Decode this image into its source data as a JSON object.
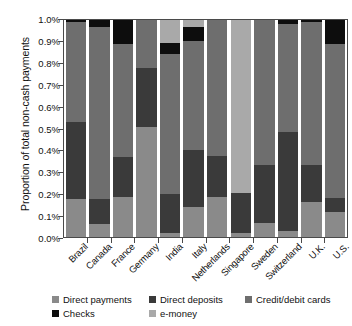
{
  "chart_data": {
    "type": "bar",
    "stacked": true,
    "title": "",
    "xlabel": "",
    "ylabel": "Proportion of total non-cash payments",
    "ylim": [
      0,
      1.0
    ],
    "ytick_labels": [
      "0.0%",
      "0.1%",
      "0.2%",
      "0.3%",
      "0.4%",
      "0.5%",
      "0.6%",
      "0.7%",
      "0.8%",
      "0.9%",
      "1.0%"
    ],
    "ytick_values": [
      0,
      0.1,
      0.2,
      0.3,
      0.4,
      0.5,
      0.6,
      0.7,
      0.8,
      0.9,
      1.0
    ],
    "grid": false,
    "legend_position": "bottom",
    "categories": [
      "Brazil",
      "Canada",
      "France",
      "Germany",
      "India",
      "Italy",
      "Netherlands",
      "Singapore",
      "Sweden",
      "Switzerland",
      "U.K.",
      "U.S."
    ],
    "series": [
      {
        "name": "Direct payments",
        "color": "#8a8a8a",
        "values": [
          0.175,
          0.06,
          0.185,
          0.505,
          0.02,
          0.14,
          0.185,
          0.02,
          0.065,
          0.03,
          0.16,
          0.115
        ]
      },
      {
        "name": "Direct deposits",
        "color": "#3a3a3a",
        "values": [
          0.355,
          0.115,
          0.185,
          0.275,
          0.18,
          0.26,
          0.19,
          0.185,
          0.265,
          0.455,
          0.17,
          0.065
        ]
      },
      {
        "name": "Credit/debit cards",
        "color": "#6e6e6e",
        "values": [
          0.46,
          0.795,
          0.52,
          0.22,
          0.645,
          0.505,
          0.625,
          0.0,
          0.67,
          0.495,
          0.66,
          0.71
        ]
      },
      {
        "name": "Checks",
        "color": "#0d0d0d",
        "values": [
          0.01,
          0.03,
          0.11,
          0.0,
          0.05,
          0.065,
          0.0,
          0.0,
          0.0,
          0.02,
          0.01,
          0.11
        ]
      },
      {
        "name": "e-money",
        "color": "#a9a9a9",
        "values": [
          0.0,
          0.0,
          0.0,
          0.0,
          0.105,
          0.03,
          0.0,
          0.795,
          0.0,
          0.0,
          0.0,
          0.0
        ]
      }
    ],
    "stack_order": [
      "Direct payments",
      "Direct deposits",
      "Credit/debit cards",
      "Checks",
      "e-money"
    ],
    "per_country_stack": [
      {
        "country": "Brazil",
        "segments": [
          {
            "name": "Direct payments",
            "value": 0.175
          },
          {
            "name": "Direct deposits",
            "value": 0.355
          },
          {
            "name": "Credit/debit cards",
            "value": 0.46
          },
          {
            "name": "Checks",
            "value": 0.01
          }
        ]
      },
      {
        "country": "Canada",
        "segments": [
          {
            "name": "Direct payments",
            "value": 0.06
          },
          {
            "name": "Direct deposits",
            "value": 0.115
          },
          {
            "name": "Credit/debit cards",
            "value": 0.795
          },
          {
            "name": "Checks",
            "value": 0.03
          }
        ]
      },
      {
        "country": "France",
        "segments": [
          {
            "name": "Direct payments",
            "value": 0.185
          },
          {
            "name": "Direct deposits",
            "value": 0.185
          },
          {
            "name": "Credit/debit cards",
            "value": 0.52
          },
          {
            "name": "Checks",
            "value": 0.11
          }
        ]
      },
      {
        "country": "Germany",
        "segments": [
          {
            "name": "Direct payments",
            "value": 0.505
          },
          {
            "name": "Direct deposits",
            "value": 0.275
          },
          {
            "name": "Credit/debit cards",
            "value": 0.22
          }
        ]
      },
      {
        "country": "India",
        "segments": [
          {
            "name": "Direct payments",
            "value": 0.02
          },
          {
            "name": "Direct deposits",
            "value": 0.18
          },
          {
            "name": "Credit/debit cards",
            "value": 0.645
          },
          {
            "name": "Checks",
            "value": 0.05
          },
          {
            "name": "e-money",
            "value": 0.105
          }
        ]
      },
      {
        "country": "Italy",
        "segments": [
          {
            "name": "Direct payments",
            "value": 0.14
          },
          {
            "name": "Direct deposits",
            "value": 0.26
          },
          {
            "name": "Credit/debit cards",
            "value": 0.505
          },
          {
            "name": "Checks",
            "value": 0.065
          },
          {
            "name": "e-money",
            "value": 0.03
          }
        ]
      },
      {
        "country": "Netherlands",
        "segments": [
          {
            "name": "Direct payments",
            "value": 0.185
          },
          {
            "name": "Direct deposits",
            "value": 0.19
          },
          {
            "name": "Credit/debit cards",
            "value": 0.625
          }
        ]
      },
      {
        "country": "Singapore",
        "segments": [
          {
            "name": "Direct payments",
            "value": 0.02
          },
          {
            "name": "Direct deposits",
            "value": 0.185
          },
          {
            "name": "e-money",
            "value": 0.795
          }
        ]
      },
      {
        "country": "Sweden",
        "segments": [
          {
            "name": "Direct payments",
            "value": 0.065
          },
          {
            "name": "Direct deposits",
            "value": 0.265
          },
          {
            "name": "Credit/debit cards",
            "value": 0.67
          }
        ]
      },
      {
        "country": "Switzerland",
        "segments": [
          {
            "name": "Direct payments",
            "value": 0.03
          },
          {
            "name": "Direct deposits",
            "value": 0.455
          },
          {
            "name": "Credit/debit cards",
            "value": 0.495
          },
          {
            "name": "Checks",
            "value": 0.02
          }
        ]
      },
      {
        "country": "U.K.",
        "segments": [
          {
            "name": "Direct payments",
            "value": 0.16
          },
          {
            "name": "Direct deposits",
            "value": 0.17
          },
          {
            "name": "Credit/debit cards",
            "value": 0.66
          },
          {
            "name": "Checks",
            "value": 0.01
          }
        ]
      },
      {
        "country": "U.S.",
        "segments": [
          {
            "name": "Direct payments",
            "value": 0.115
          },
          {
            "name": "Direct deposits",
            "value": 0.065
          },
          {
            "name": "Credit/debit cards",
            "value": 0.71
          },
          {
            "name": "Checks",
            "value": 0.11
          }
        ]
      }
    ]
  },
  "legend": {
    "items": [
      {
        "label": "Direct payments",
        "color": "#8a8a8a",
        "row": 0,
        "col": 0
      },
      {
        "label": "Direct deposits",
        "color": "#3a3a3a",
        "row": 0,
        "col": 1
      },
      {
        "label": "Credit/debit cards",
        "color": "#6e6e6e",
        "row": 0,
        "col": 2
      },
      {
        "label": "Checks",
        "color": "#0d0d0d",
        "row": 1,
        "col": 0
      },
      {
        "label": "e-money",
        "color": "#a9a9a9",
        "row": 1,
        "col": 1
      }
    ]
  },
  "colors": {
    "axis": "#4a4a4a",
    "text": "#111111",
    "background": "#ffffff"
  }
}
